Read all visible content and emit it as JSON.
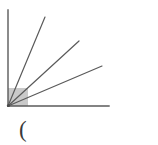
{
  "figure": {
    "background_color": "#ffffff",
    "stroke_color": "#5a5a5a",
    "stroke_width": 1.2,
    "shade_color": "#c9c9c9",
    "vertex": {
      "x": 8,
      "y": 106,
      "label": ""
    },
    "axes": {
      "vertical_ray": {
        "from_x": 8,
        "from_y": 106,
        "to_x": 8,
        "to_y": 10,
        "label": "vertical-ray"
      },
      "horizontal_ray": {
        "from_x": 8,
        "from_y": 106,
        "to_x": 109,
        "to_y": 106,
        "label": "horizontal-ray"
      }
    },
    "rays": [
      {
        "name": "ray-1",
        "from_x": 8,
        "from_y": 106,
        "to_x": 45,
        "to_y": 17,
        "angle_deg": 67
      },
      {
        "name": "ray-2",
        "from_x": 8,
        "from_y": 106,
        "to_x": 79,
        "to_y": 41,
        "angle_deg": 42
      },
      {
        "name": "ray-3",
        "from_x": 8,
        "from_y": 106,
        "to_x": 102,
        "to_y": 66,
        "angle_deg": 23
      }
    ],
    "shaded_region": {
      "name": "angle-shade-wedge",
      "x": 8,
      "y": 88,
      "width": 20,
      "height": 18,
      "color": "#c9c9c9"
    }
  },
  "caption": {
    "text": "(",
    "x": 19,
    "y": 118,
    "color": "#3a3a3a"
  },
  "chart_data": {
    "type": "scatter",
    "title": "",
    "xlabel": "",
    "ylabel": "",
    "grid": false,
    "legend": "none",
    "xlim": [
      0,
      158
    ],
    "ylim": [
      0,
      145
    ],
    "series": [
      {
        "name": "rays-from-vertex",
        "x": [
          8,
          8,
          45,
          79,
          102,
          109
        ],
        "y": [
          106,
          10,
          17,
          41,
          66,
          106
        ],
        "annotations": [
          "vertex",
          "vertical-ray-end",
          "ray-1-end",
          "ray-2-end",
          "ray-3-end",
          "horizontal-ray-end"
        ]
      }
    ]
  }
}
